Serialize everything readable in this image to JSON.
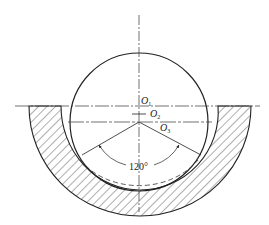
{
  "diagram": {
    "colors": {
      "line": "#222222",
      "hatch": "#333333",
      "background": "#ffffff"
    },
    "labels": {
      "o1": {
        "main": "O",
        "sub": "1"
      },
      "o2": {
        "main": "O",
        "sub": "2"
      },
      "o3": {
        "main": "O",
        "sub": "3"
      },
      "angle": "120°"
    },
    "elements": [
      "vertical center line",
      "horizontal center line",
      "ball circle",
      "hatched socket section",
      "dashed contact arc",
      "120° angle dimension with arrows"
    ]
  }
}
